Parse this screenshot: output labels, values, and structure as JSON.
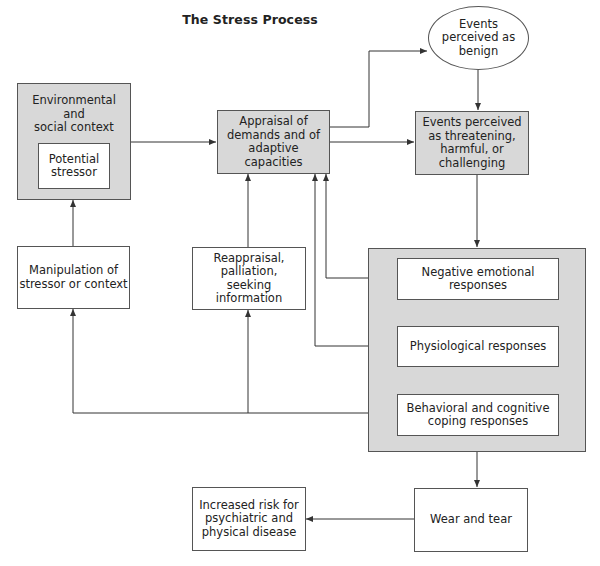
{
  "title": "The Stress Process",
  "nodes": {
    "environment": {
      "label": "Environmental\nand\nsocial context"
    },
    "stressor": {
      "label": "Potential\nstressor"
    },
    "appraisal": {
      "label": "Appraisal of\ndemands and of\nadaptive capacities"
    },
    "benign": {
      "label": "Events\nperceived as\nbenign"
    },
    "threatening": {
      "label": "Events perceived\nas threatening,\nharmful, or\nchallenging"
    },
    "manipulation": {
      "label": "Manipulation of\nstressor or context"
    },
    "reappraisal": {
      "label": "Reappraisal,\npalliation,\nseeking information"
    },
    "negative": {
      "label": "Negative emotional\nresponses"
    },
    "physiological": {
      "label": "Physiological responses"
    },
    "behavioral": {
      "label": "Behavioral and cognitive\ncoping responses"
    },
    "wear": {
      "label": "Wear and tear"
    },
    "risk": {
      "label": "Increased risk for\npsychiatric and\nphysical disease"
    }
  },
  "edges": [
    {
      "from": "environment",
      "to": "appraisal"
    },
    {
      "from": "appraisal",
      "to": "benign"
    },
    {
      "from": "appraisal",
      "to": "threatening"
    },
    {
      "from": "benign",
      "to": "threatening"
    },
    {
      "from": "threatening",
      "to": "responses-group"
    },
    {
      "from": "negative",
      "to": "appraisal"
    },
    {
      "from": "physiological",
      "to": "appraisal"
    },
    {
      "from": "negative",
      "to": "physiological",
      "bidirectional": true
    },
    {
      "from": "physiological",
      "to": "behavioral",
      "bidirectional": true
    },
    {
      "from": "behavioral",
      "to": "manipulation"
    },
    {
      "from": "behavioral",
      "to": "reappraisal"
    },
    {
      "from": "manipulation",
      "to": "environment"
    },
    {
      "from": "reappraisal",
      "to": "appraisal"
    },
    {
      "from": "responses-group",
      "to": "wear"
    },
    {
      "from": "wear",
      "to": "risk"
    }
  ],
  "colors": {
    "box_fill_gray": "#d8d8d8",
    "line": "#333333"
  }
}
